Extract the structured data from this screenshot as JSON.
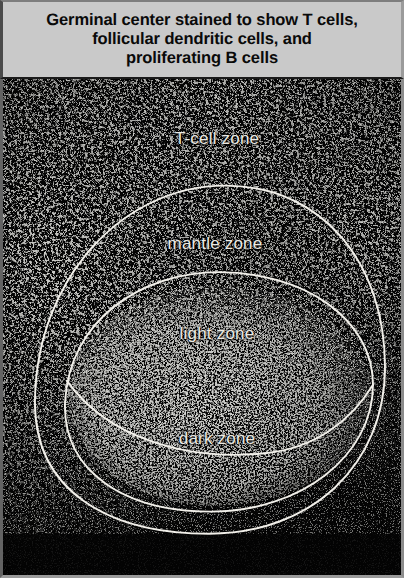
{
  "figure": {
    "caption": "Germinal center stained to show T cells,\nfollicular dendritic cells, and\nproliferating B cells",
    "caption_line_1": "Germinal center stained to show T cells,",
    "caption_line_2": "follicular dendritic cells, and",
    "caption_line_3": "proliferating B cells",
    "caption_background_color": "#c9c9c9",
    "caption_text_color": "#0a0a0a",
    "panel_background_color": "#050505",
    "annotation_line_color": "#f2f0ea",
    "annotation_text_color": "#eceae4",
    "image_type": "immunofluorescence-micrograph"
  },
  "annotations": {
    "labels": [
      {
        "id": "t-cell-zone",
        "text": "T-cell zone"
      },
      {
        "id": "mantle-zone",
        "text": "mantle zone"
      },
      {
        "id": "light-zone",
        "text": "light zone"
      },
      {
        "id": "dark-zone",
        "text": "dark zone"
      }
    ]
  }
}
